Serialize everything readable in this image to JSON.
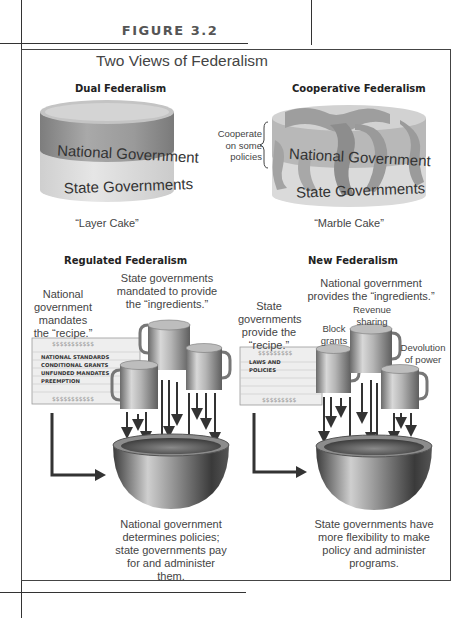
{
  "figure": {
    "label": "FIGURE 3.2",
    "title": "Two Views of Federalism"
  },
  "dual": {
    "heading": "Dual Federalism",
    "top_layer": "National Government",
    "bottom_layer": "State Governments",
    "caption": "“Layer Cake”"
  },
  "cooperative": {
    "heading": "Cooperative Federalism",
    "brace_note": [
      "Cooperate",
      "on some",
      "policies"
    ],
    "top_layer": "National Government",
    "bottom_layer": "State Governments",
    "caption": "“Marble Cake”"
  },
  "regulated": {
    "heading": "Regulated Federalism",
    "recipe_note": [
      "National",
      "government",
      "mandates",
      "the “recipe.”"
    ],
    "ingredients_note": [
      "State governments",
      "mandated to provide",
      "the “ingredients.”"
    ],
    "card_items": [
      "NATIONAL STANDARDS",
      "CONDITIONAL GRANTS",
      "UNFUNDED MANDATES",
      "PREEMPTION"
    ],
    "card_border_glyphs": "$$$$$$$$$$$",
    "result": [
      "National government",
      "determines policies;",
      "state governments pay",
      "for and administer",
      "them."
    ]
  },
  "new": {
    "heading": "New Federalism",
    "recipe_note": [
      "State",
      "governments",
      "provide the",
      "“recipe.”"
    ],
    "ingredients_note": [
      "National government",
      "provides the “ingredients.”"
    ],
    "mug_labels": {
      "block": [
        "Block",
        "grants"
      ],
      "revenue": [
        "Revenue",
        "sharing"
      ],
      "devolution": [
        "Devolution",
        "of power"
      ]
    },
    "card_items": [
      "LAWS AND",
      "POLICIES"
    ],
    "card_border_glyphs": "$$$$$$$$$$$",
    "result": [
      "State governments have",
      "more flexibility to make",
      "policy and administer",
      "programs."
    ]
  },
  "colors": {
    "frame": "#444444",
    "text": "#333333",
    "national_band": "#8e8e8e",
    "state_band": "#d9d9d9",
    "card_fill": "#eeeeee",
    "metal_dark": "#5a5a5a",
    "metal_light": "#e0e0e0"
  }
}
